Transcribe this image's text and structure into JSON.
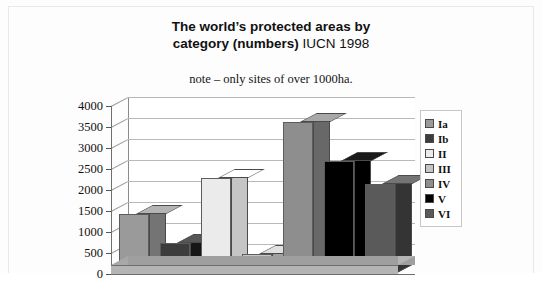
{
  "title": {
    "bold_part": "The world’s protected areas by category (numbers)",
    "normal_part": " IUCN 1998",
    "line1_bold": "The world’s protected areas by",
    "line2_bold": "category (numbers)",
    "line2_normal": " IUCN 1998"
  },
  "subtitle": "note – only sites of over 1000ha.",
  "legend": {
    "position": "right",
    "items": [
      {
        "label": "Ia",
        "color": "#9a9a9a"
      },
      {
        "label": "Ib",
        "color": "#3c3c3c"
      },
      {
        "label": "II",
        "color": "#ebebeb"
      },
      {
        "label": "III",
        "color": "#c6c6c6"
      },
      {
        "label": "IV",
        "color": "#8e8e8e"
      },
      {
        "label": "V",
        "color": "#000000"
      },
      {
        "label": "VI",
        "color": "#5a5a5a"
      }
    ]
  },
  "axis": {
    "y_ticks": [
      "4000",
      "3500",
      "3000",
      "2500",
      "2000",
      "1500",
      "1000",
      "500",
      "0"
    ],
    "y_min": 0,
    "y_max": 4000,
    "y_step": 500,
    "x_tick_labels": []
  },
  "chart_data": {
    "type": "bar",
    "title": "The world’s protected areas by category (numbers) IUCN 1998",
    "subtitle": "note – only sites of over 1000ha.",
    "xlabel": "",
    "ylabel": "",
    "ylim": [
      0,
      4000
    ],
    "ystep": 500,
    "grid": true,
    "legend_position": "right",
    "style": "3d-column",
    "categories": [
      "Ia",
      "Ib",
      "II",
      "III",
      "IV",
      "V",
      "VI"
    ],
    "values": [
      1430,
      740,
      2290,
      480,
      3620,
      2690,
      2140
    ],
    "colors": [
      "#9a9a9a",
      "#3c3c3c",
      "#ebebeb",
      "#c6c6c6",
      "#8e8e8e",
      "#000000",
      "#5a5a5a"
    ],
    "series": [
      {
        "name": "Number of protected areas",
        "values": [
          1430,
          740,
          2290,
          480,
          3620,
          2690,
          2140
        ]
      }
    ],
    "points": [
      {
        "category": "Ia",
        "value": 1430
      },
      {
        "category": "Ib",
        "value": 740
      },
      {
        "category": "II",
        "value": 2290
      },
      {
        "category": "III",
        "value": 480
      },
      {
        "category": "IV",
        "value": 3620
      },
      {
        "category": "V",
        "value": 2690
      },
      {
        "category": "VI",
        "value": 2140
      }
    ]
  }
}
